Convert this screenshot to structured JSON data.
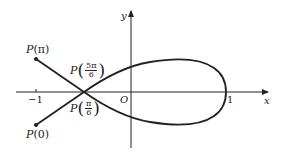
{
  "diagram": {
    "axes": {
      "x_label": "x",
      "y_label": "y",
      "origin_label": "O",
      "tick_neg1": "−1",
      "tick_pos1": "1"
    },
    "points": {
      "p_pi": {
        "prefix": "P",
        "arg": "(π)"
      },
      "p_zero": {
        "prefix": "P",
        "arg": "(0)"
      },
      "p_5pi6": {
        "prefix": "P",
        "num": "5π",
        "den": "6",
        "open": "(",
        "close": ")"
      },
      "p_pi6": {
        "prefix": "P",
        "num": "π",
        "den": "6",
        "open": "(",
        "close": ")"
      }
    },
    "colors": {
      "stroke": "#222222",
      "background": "#ffffff"
    }
  }
}
